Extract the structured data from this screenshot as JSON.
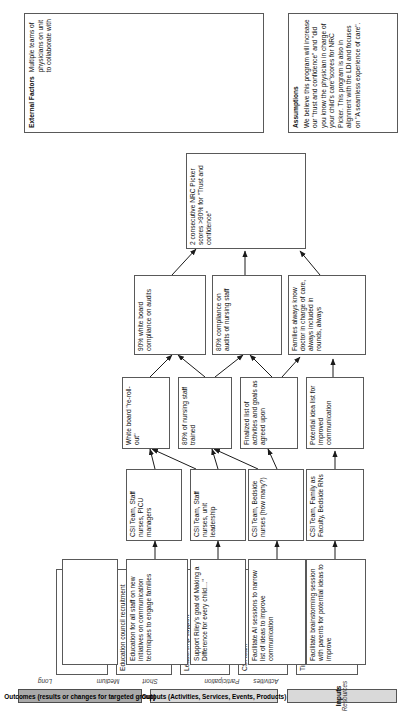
{
  "headers": {
    "inputs": {
      "title": "Inputs",
      "sub": [
        "Resources"
      ]
    },
    "outputs": {
      "title": "Outputs (Activities, Services, Events, Products)",
      "sub": [
        "Activities",
        "Participation"
      ]
    },
    "outcomes": {
      "title": "Outcomes (results or changes for targeted group)",
      "sub": [
        "Short",
        "Medium",
        "Long"
      ]
    }
  },
  "columns": {
    "resources": [
      "Time, Meeting Location",
      "CSI team",
      "Leadership support",
      "Education council recruitment",
      ""
    ],
    "activities": [
      "Facilitate brainstorming session with parents for potential ideas to improve",
      "Facilitate AI sessions to narrow list of ideas to improve communication",
      "Support Riley's goal of Making a Difference for every child…\"",
      "Education for all staff on new initiatives on communication techniques to engage families",
      ""
    ],
    "participation": [
      "CSI Team, Family as Faculty, Bedside RNs",
      "CSI Team, Bedside nurses (how many?)",
      "CSI Team, Staff nurses, unit leadership",
      "CSI Team, Staff nurses, PICU managers"
    ],
    "short": [
      "Potential idea list for improved communication",
      "Finalized list of activities and goals as agreed upon",
      "80% of nursing staff trained",
      "White board \"re-roll-out\""
    ],
    "medium": [
      "Families always know doctor in charge of care, always included in rounds, always",
      "80% compliance on audits of nursing staff",
      "90% white board compliance on audits"
    ],
    "long": [
      "2 consecutive NRC Picker scores >90% for \"Trust and confidence\""
    ]
  },
  "assumptions": {
    "title": "Assumptions",
    "text": "We believe this program will increase our \"trust and confidence\" and \"did you know the physician in charge of your child's care\"scores for NRC Picker.  This program is also in alignment with the LDI and focuses on \"A seamless experience of care\"."
  },
  "external_factors": {
    "title": "External Factors",
    "text": "Multiple teams of physicians on unit to collaborate with"
  }
}
